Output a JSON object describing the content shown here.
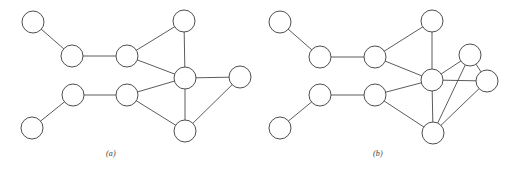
{
  "figure": {
    "background_color": "#ffffff",
    "stroke_color": "#4a4a4a",
    "node_fill_color": "#ffffff",
    "node_stroke_color": "#444444",
    "node_radius": 11,
    "width": 522,
    "height": 173
  },
  "panels": [
    {
      "id": "panel-a",
      "caption": "(a)",
      "caption_x": 106,
      "caption_y": 149,
      "nodes": [
        {
          "id": "a1",
          "label": "",
          "x": 33,
          "y": 22
        },
        {
          "id": "a2",
          "label": "",
          "x": 72,
          "y": 56
        },
        {
          "id": "a3",
          "label": "",
          "x": 127,
          "y": 56
        },
        {
          "id": "a4",
          "label": "",
          "x": 184,
          "y": 21
        },
        {
          "id": "a5",
          "label": "",
          "x": 185,
          "y": 78
        },
        {
          "id": "a6",
          "label": "",
          "x": 240,
          "y": 77
        },
        {
          "id": "a7",
          "label": "",
          "x": 73,
          "y": 95
        },
        {
          "id": "a8",
          "label": "",
          "x": 32,
          "y": 128
        },
        {
          "id": "a9",
          "label": "",
          "x": 127,
          "y": 95
        },
        {
          "id": "a10",
          "label": "",
          "x": 185,
          "y": 131
        }
      ],
      "edges": [
        {
          "from": "a1",
          "to": "a2"
        },
        {
          "from": "a2",
          "to": "a3"
        },
        {
          "from": "a3",
          "to": "a4"
        },
        {
          "from": "a3",
          "to": "a5"
        },
        {
          "from": "a4",
          "to": "a5"
        },
        {
          "from": "a5",
          "to": "a6"
        },
        {
          "from": "a5",
          "to": "a9"
        },
        {
          "from": "a5",
          "to": "a10"
        },
        {
          "from": "a6",
          "to": "a10"
        },
        {
          "from": "a8",
          "to": "a7"
        },
        {
          "from": "a7",
          "to": "a9"
        },
        {
          "from": "a9",
          "to": "a10"
        }
      ]
    },
    {
      "id": "panel-b",
      "caption": "(b)",
      "caption_x": 373,
      "caption_y": 149,
      "nodes": [
        {
          "id": "b1",
          "label": "",
          "x": 280,
          "y": 22
        },
        {
          "id": "b2",
          "label": "",
          "x": 320,
          "y": 57
        },
        {
          "id": "b3",
          "label": "",
          "x": 375,
          "y": 57
        },
        {
          "id": "b4",
          "label": "",
          "x": 432,
          "y": 21
        },
        {
          "id": "b5",
          "label": "",
          "x": 432,
          "y": 80
        },
        {
          "id": "b6",
          "label": "",
          "x": 470,
          "y": 55
        },
        {
          "id": "b7",
          "label": "",
          "x": 487,
          "y": 81
        },
        {
          "id": "b8",
          "label": "",
          "x": 320,
          "y": 95
        },
        {
          "id": "b9",
          "label": "",
          "x": 280,
          "y": 128
        },
        {
          "id": "b10",
          "label": "",
          "x": 375,
          "y": 95
        },
        {
          "id": "b11",
          "label": "",
          "x": 433,
          "y": 133
        }
      ],
      "edges": [
        {
          "from": "b1",
          "to": "b2"
        },
        {
          "from": "b2",
          "to": "b3"
        },
        {
          "from": "b3",
          "to": "b4"
        },
        {
          "from": "b3",
          "to": "b5"
        },
        {
          "from": "b4",
          "to": "b5"
        },
        {
          "from": "b5",
          "to": "b6"
        },
        {
          "from": "b5",
          "to": "b7"
        },
        {
          "from": "b5",
          "to": "b10"
        },
        {
          "from": "b5",
          "to": "b11"
        },
        {
          "from": "b6",
          "to": "b7"
        },
        {
          "from": "b6",
          "to": "b11"
        },
        {
          "from": "b7",
          "to": "b11"
        },
        {
          "from": "b9",
          "to": "b8"
        },
        {
          "from": "b8",
          "to": "b10"
        },
        {
          "from": "b10",
          "to": "b11"
        }
      ]
    }
  ]
}
